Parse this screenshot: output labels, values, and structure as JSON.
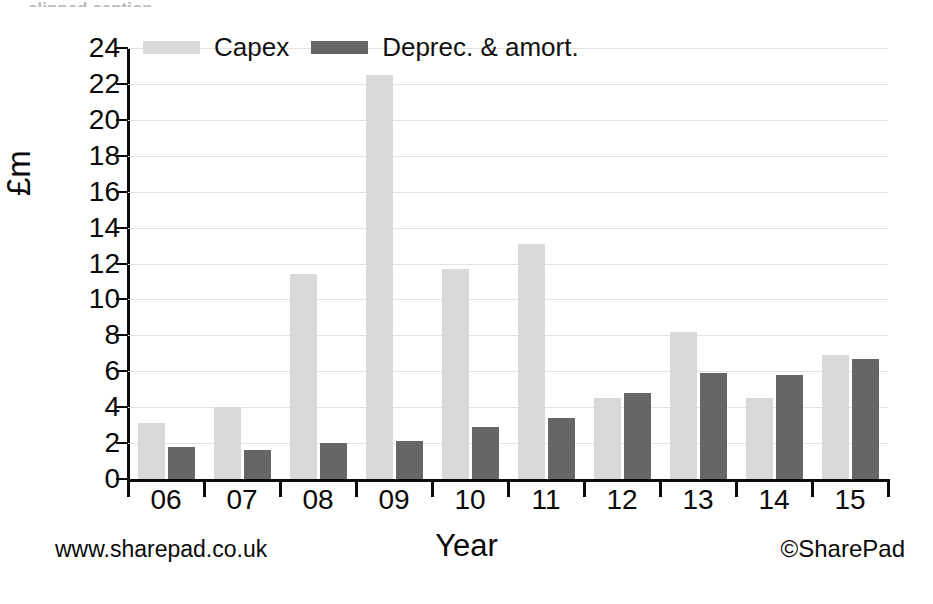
{
  "chart_data": {
    "type": "bar",
    "title": "",
    "xlabel": "Year",
    "ylabel": "£m",
    "categories": [
      "06",
      "07",
      "08",
      "09",
      "10",
      "11",
      "12",
      "13",
      "14",
      "15"
    ],
    "series": [
      {
        "name": "Capex",
        "color": "#d9d9d9",
        "values": [
          3.1,
          4.0,
          11.4,
          22.5,
          11.7,
          13.1,
          4.5,
          8.2,
          4.5,
          6.9
        ]
      },
      {
        "name": "Deprec. & amort.",
        "color": "#666666",
        "values": [
          1.8,
          1.6,
          2.0,
          2.1,
          2.9,
          3.4,
          4.8,
          5.9,
          5.8,
          6.7
        ]
      }
    ],
    "ylim": [
      0,
      24
    ],
    "ytick_values": [
      0,
      2,
      4,
      6,
      8,
      10,
      12,
      14,
      16,
      18,
      20,
      22,
      24
    ],
    "ytick_labels": [
      "0",
      "2",
      "4",
      "6",
      "8",
      "10",
      "12",
      "14",
      "16",
      "18",
      "20",
      "22",
      "24"
    ],
    "grid": true,
    "grid_color": "#e2e2e2",
    "legend_position": "top-left",
    "axis_color": "#0a0a0a"
  },
  "legend": {
    "items": [
      {
        "label": "Capex",
        "color": "#d9d9d9"
      },
      {
        "label": "Deprec. & amort.",
        "color": "#666666"
      }
    ]
  },
  "footer": {
    "website": "www.sharepad.co.uk",
    "x_axis_title": "Year",
    "copyright": "©SharePad"
  },
  "top_caption": {
    "text": "clipped caption"
  }
}
